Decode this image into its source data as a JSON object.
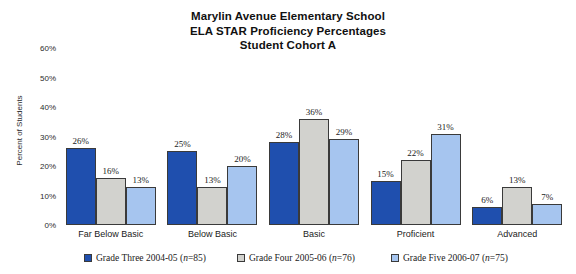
{
  "chart_data": {
    "type": "bar",
    "title": "Marylin Avenue Elementary School ELA STAR Proficiency Percentages Student Cohort A",
    "title_lines": [
      "Marylin Avenue Elementary School",
      "ELA STAR Proficiency Percentages",
      "Student Cohort A"
    ],
    "xlabel": "",
    "ylabel": "Percent of Students",
    "ylim": [
      0,
      60
    ],
    "ytick_labels": [
      "0%",
      "10%",
      "20%",
      "30%",
      "40%",
      "50%",
      "60%"
    ],
    "ytick_values": [
      0,
      10,
      20,
      30,
      40,
      50,
      60
    ],
    "grid": false,
    "legend_position": "bottom",
    "categories": [
      "Far Below Basic",
      "Below Basic",
      "Basic",
      "Proficient",
      "Advanced"
    ],
    "series": [
      {
        "name": "Grade Three 2004-05 (n=85)",
        "label_prefix": "Grade Three 2004-05 (",
        "label_n": "n",
        "label_suffix": "=85)",
        "color": "#1f4fae",
        "values": [
          26,
          25,
          28,
          15,
          6
        ],
        "value_labels": [
          "26%",
          "25%",
          "28%",
          "15%",
          "6%"
        ]
      },
      {
        "name": "Grade Four 2005-06 (n=76)",
        "label_prefix": "Grade Four 2005-06 (",
        "label_n": "n",
        "label_suffix": "=76)",
        "color": "#d2d2ce",
        "values": [
          16,
          13,
          36,
          22,
          13
        ],
        "value_labels": [
          "16%",
          "13%",
          "36%",
          "22%",
          "13%"
        ]
      },
      {
        "name": "Grade Five 2006-07 (n=75)",
        "label_prefix": "Grade Five 2006-07 (",
        "label_n": "n",
        "label_suffix": "=75)",
        "color": "#a6c5ef",
        "values": [
          13,
          20,
          29,
          31,
          7
        ],
        "value_labels": [
          "13%",
          "20%",
          "29%",
          "31%",
          "7%"
        ]
      }
    ]
  }
}
